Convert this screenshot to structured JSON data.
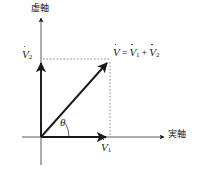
{
  "figure": {
    "type": "phasor-vector-diagram",
    "background_color": "#ffffff",
    "ink_color": "#1a1a1a",
    "axes": {
      "vertical_label": "虚軸",
      "horizontal_label": "実軸",
      "vertical_label_meaning": "imaginary-axis",
      "horizontal_label_meaning": "real-axis",
      "origin_px": [
        41,
        137
      ]
    },
    "labels": {
      "v2": {
        "symbol": "V",
        "accent": "dot",
        "subscript": "2"
      },
      "v1": {
        "symbol": "V",
        "accent": "dot",
        "subscript": "1"
      },
      "angle": "θ",
      "resultant": {
        "lhs_symbol": "V",
        "lhs_accent": "dot",
        "equals": "=",
        "term1_symbol": "V",
        "term1_subscript": "1",
        "plus": "+",
        "term2_symbol": "V",
        "term2_subscript": "2",
        "plain_text": "V̇ = V̇₁ + V̇₂"
      }
    },
    "vectors": [
      {
        "name": "v1",
        "from_px": [
          41,
          137
        ],
        "to_px": [
          110,
          137
        ],
        "style": "solid-arrow"
      },
      {
        "name": "v2",
        "from_px": [
          41,
          137
        ],
        "to_px": [
          41,
          59
        ],
        "style": "solid-arrow"
      },
      {
        "name": "resultant",
        "from_px": [
          41,
          137
        ],
        "to_px": [
          110,
          60
        ],
        "style": "solid-arrow"
      }
    ],
    "construction_lines": [
      {
        "name": "horizontal-projection",
        "from_px": [
          41,
          59
        ],
        "to_px": [
          110,
          59
        ],
        "style": "dotted"
      },
      {
        "name": "vertical-projection",
        "from_px": [
          110,
          60
        ],
        "to_px": [
          110,
          137
        ],
        "style": "dotted"
      }
    ]
  }
}
